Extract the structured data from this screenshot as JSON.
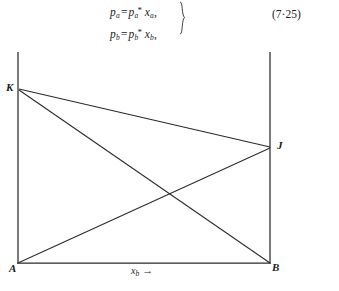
{
  "equations": {
    "lines": [
      {
        "id": "equation-pa",
        "lhs_base": "p",
        "lhs_sub": "a",
        "relation": "=",
        "rhs_base": "p",
        "rhs_sub": "a",
        "rhs_star": "*",
        "var_base": "x",
        "var_sub": "a",
        "trailing": ",",
        "plain": "p_a = p_a* x_a,"
      },
      {
        "id": "equation-pb",
        "lhs_base": "p",
        "lhs_sub": "b",
        "relation": "=",
        "rhs_base": "p",
        "rhs_sub": "b",
        "rhs_star": "*",
        "var_base": "x",
        "var_sub": "b",
        "trailing": ",",
        "plain": "p_b = p_b* x_b,"
      }
    ],
    "brace": "}",
    "number": "(7·25)"
  },
  "figure": {
    "labels": {
      "K": "K",
      "J": "J",
      "A": "A",
      "B": "B"
    },
    "axis_label_x": {
      "base": "x",
      "sub": "b",
      "arrow": "→"
    },
    "caption": "",
    "geometry": {
      "description": "Box diagram with two vertical side lines, a horizontal base line A-B, and two crossing diagonals K-J-ish chords",
      "points": {
        "A": [
          18,
          219
        ],
        "B": [
          270,
          219
        ],
        "K": [
          19,
          45
        ],
        "J": [
          270,
          103
        ],
        "left_axis_top": [
          18,
          8
        ],
        "right_axis_top": [
          270,
          8
        ]
      },
      "segments": [
        {
          "name": "left-vertical-axis",
          "from": "left_axis_top",
          "to": "A"
        },
        {
          "name": "right-vertical-axis",
          "from": "right_axis_top",
          "to": "B"
        },
        {
          "name": "baseline-AB",
          "from": "A",
          "to": "B"
        },
        {
          "name": "chord-KJ",
          "from": "K",
          "to": "J"
        },
        {
          "name": "chord-KB",
          "from": "K",
          "to": "B"
        },
        {
          "name": "chord-AJ",
          "from": "A",
          "to": "J"
        }
      ],
      "intersection_KB_AJ": [
        175,
        153
      ]
    },
    "colors": {
      "ink": "#2a2a2a",
      "background": "#ffffff"
    }
  }
}
